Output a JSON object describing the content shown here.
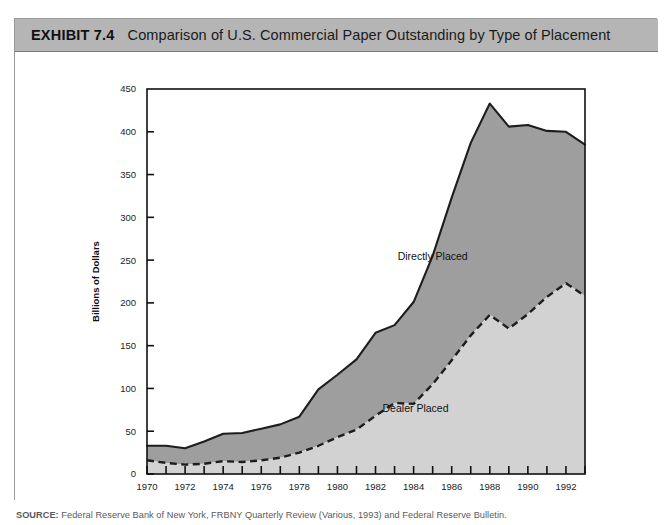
{
  "exhibit": {
    "number": "EXHIBIT 7.4",
    "title": "Comparison of U.S. Commercial Paper Outstanding by Type of Placement",
    "header_bg": "#b5b5b5"
  },
  "source": {
    "label": "SOURCE:",
    "text": " Federal Reserve Bank of New York, FRBNY Quarterly Review (Various, 1993) and Federal Reserve Bulletin."
  },
  "chart_data": {
    "type": "area",
    "title": "Comparison of U.S. Commercial Paper Outstanding by Type of Placement",
    "subtitle": "",
    "xlabel": "Year",
    "ylabel": "Billions of Dollars",
    "xlim": [
      1970,
      1993
    ],
    "ylim": [
      0,
      450
    ],
    "ytick_step": 50,
    "yticks": [
      0,
      50,
      100,
      150,
      200,
      250,
      300,
      350,
      400,
      450
    ],
    "xticks": [
      1970,
      1972,
      1974,
      1976,
      1978,
      1980,
      1982,
      1984,
      1986,
      1988,
      1990,
      1992
    ],
    "xtick_minor_step": 1,
    "grid": false,
    "legend": "inline-annotations",
    "stacked": true,
    "annotations": [
      {
        "text": "Directly Placed",
        "x": 1985.0,
        "y": 250
      },
      {
        "text": "Dealer Placed",
        "x": 1984.1,
        "y": 72
      }
    ],
    "x": [
      1970,
      1971,
      1972,
      1973,
      1974,
      1975,
      1976,
      1977,
      1978,
      1979,
      1980,
      1981,
      1982,
      1983,
      1984,
      1985,
      1986,
      1987,
      1988,
      1989,
      1990,
      1991,
      1992,
      1993
    ],
    "series": [
      {
        "name": "Dealer Placed",
        "color": "#d2d2d2",
        "line_style": "dashed",
        "values": [
          16,
          13,
          11,
          12,
          15,
          14,
          16,
          19,
          25,
          33,
          43,
          52,
          68,
          83,
          82,
          105,
          133,
          162,
          186,
          170,
          187,
          207,
          223,
          208
        ]
      },
      {
        "name": "Directly Placed",
        "color": "#9e9e9e",
        "line_style": "solid",
        "values": [
          17,
          20,
          19,
          26,
          32,
          34,
          37,
          39,
          42,
          66,
          73,
          82,
          97,
          91,
          119,
          150,
          190,
          225,
          247,
          236,
          221,
          194,
          177,
          177
        ]
      }
    ],
    "totals": [
      33,
      33,
      30,
      38,
      47,
      48,
      53,
      58,
      67,
      99,
      116,
      134,
      165,
      174,
      201,
      255,
      323,
      387,
      433,
      406,
      408,
      401,
      400,
      385
    ]
  }
}
